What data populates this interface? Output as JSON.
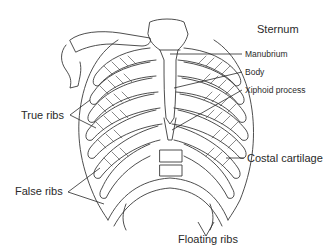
{
  "diagram": {
    "title": "Sternum",
    "labels": {
      "sternum": "Sternum",
      "manubrium": "Manubrium",
      "body": "Body",
      "xiphoid": "Xiphoid process",
      "true_ribs": "True ribs",
      "false_ribs": "False ribs",
      "costal_cartilage": "Costal cartilage",
      "floating_ribs": "Floating ribs"
    },
    "colors": {
      "line": "#3a3a3a",
      "text": "#2a2a2a",
      "background": "#ffffff"
    }
  }
}
